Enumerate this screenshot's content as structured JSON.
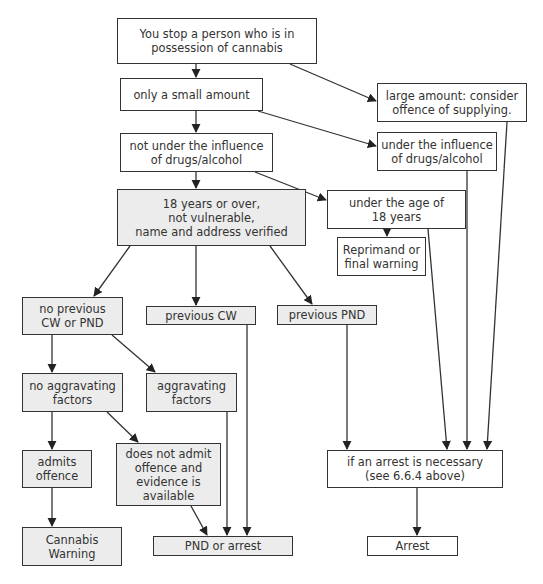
{
  "diagram": {
    "type": "flowchart",
    "fill_colors": {
      "default": "#ffffff",
      "highlighted": "#ececec"
    },
    "line_color": "#333333",
    "nodes": {
      "start": "You stop a person who is in\npossession of cannabis",
      "small_amount": "only a small amount",
      "large_amount": "large amount: consider\noffence of supplying.",
      "not_under_influence": "not under the influence\nof drugs/alcohol",
      "under_influence": "under the influence\nof drugs/alcohol",
      "over_18": "18 years or over,\nnot vulnerable,\nname and address verified",
      "under_18": "under the age of\n18 years",
      "reprimand": "Reprimand or\nfinal warning",
      "no_previous": "no previous\nCW or PND",
      "previous_cw": "previous CW",
      "previous_pnd": "previous PND",
      "no_aggravating": "no aggravating\nfactors",
      "aggravating": "aggravating\nfactors",
      "admits": "admits\noffence",
      "not_admit": "does not admit\noffence and\nevidence is\navailable",
      "arrest_necessary": "if an arrest is necessary\n(see 6.6.4 above)",
      "cannabis_warning": "Cannabis\nWarning",
      "pnd_or_arrest": "PND or arrest",
      "arrest": "Arrest"
    },
    "edges": [
      [
        "start",
        "small_amount"
      ],
      [
        "start",
        "large_amount"
      ],
      [
        "small_amount",
        "not_under_influence"
      ],
      [
        "small_amount",
        "under_influence"
      ],
      [
        "not_under_influence",
        "over_18"
      ],
      [
        "not_under_influence",
        "under_18"
      ],
      [
        "under_18",
        "reprimand"
      ],
      [
        "over_18",
        "no_previous"
      ],
      [
        "over_18",
        "previous_cw"
      ],
      [
        "over_18",
        "previous_pnd"
      ],
      [
        "no_previous",
        "no_aggravating"
      ],
      [
        "no_previous",
        "aggravating"
      ],
      [
        "no_aggravating",
        "admits"
      ],
      [
        "no_aggravating",
        "not_admit"
      ],
      [
        "admits",
        "cannabis_warning"
      ],
      [
        "not_admit",
        "pnd_or_arrest"
      ],
      [
        "aggravating",
        "pnd_or_arrest"
      ],
      [
        "previous_cw",
        "pnd_or_arrest"
      ],
      [
        "previous_pnd",
        "arrest_necessary"
      ],
      [
        "under_18",
        "arrest_necessary"
      ],
      [
        "under_influence",
        "arrest_necessary"
      ],
      [
        "large_amount",
        "arrest_necessary"
      ],
      [
        "arrest_necessary",
        "arrest"
      ]
    ]
  }
}
